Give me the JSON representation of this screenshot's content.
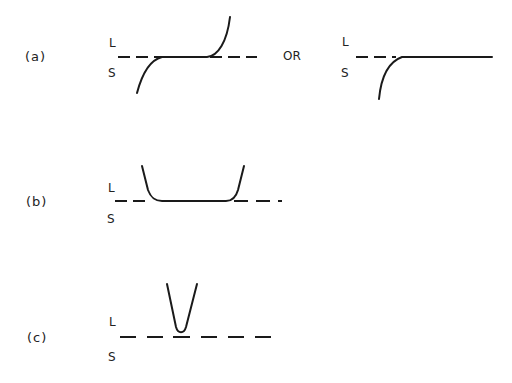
{
  "diagram": {
    "panels": [
      {
        "id": "a",
        "label": "(a)",
        "upper_phase": "L",
        "lower_phase": "S",
        "connector": "OR",
        "variants": [
          {
            "description": "Curve rising from below S, flattening along the L/S boundary, then rising steeply above into L",
            "upper_phase": "L",
            "lower_phase": "S"
          },
          {
            "description": "Curve rising from below S and flattening along the L/S boundary, continuing flat",
            "upper_phase": "L",
            "lower_phase": "S"
          }
        ]
      },
      {
        "id": "b",
        "label": "(b)",
        "upper_phase": "L",
        "lower_phase": "S",
        "description": "Wide U-shaped curve with flat bottom lying on the L/S boundary, both arms rising into L"
      },
      {
        "id": "c",
        "label": "(c)",
        "upper_phase": "L",
        "lower_phase": "S",
        "description": "Narrow V-shaped curve touching the L/S boundary at a single point, arms rising into L"
      }
    ]
  }
}
